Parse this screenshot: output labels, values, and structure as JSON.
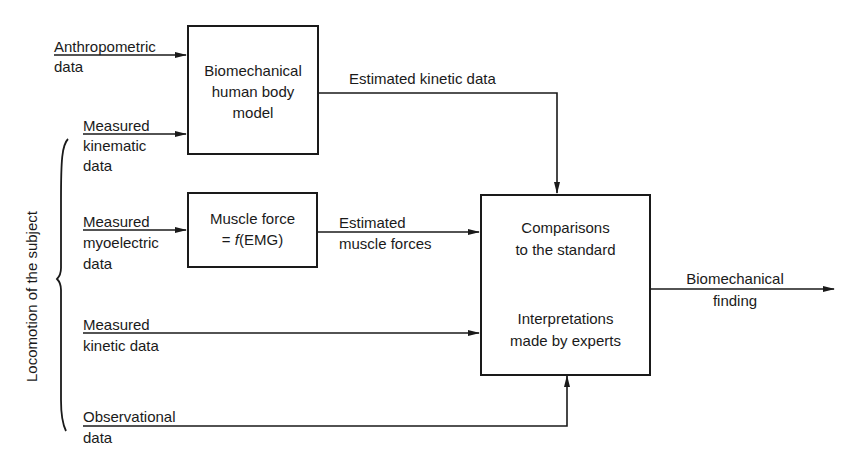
{
  "diagram": {
    "inputs": [
      {
        "id": "anthropometric",
        "line1": "Anthropometric",
        "line2": "data"
      },
      {
        "id": "kinematic",
        "line1": "Measured",
        "line2": "kinematic",
        "line3": "data"
      },
      {
        "id": "myoelectric",
        "line1": "Measured",
        "line2": "myoelectric",
        "line3": "data"
      },
      {
        "id": "kinetic",
        "line1": "Measured",
        "line2": "kinetic data"
      },
      {
        "id": "observational",
        "line1": "Observational",
        "line2": "data"
      }
    ],
    "group_label": "Locomotion of the subject",
    "boxes": {
      "body_model": {
        "line1": "Biomechanical",
        "line2": "human body",
        "line3": "model"
      },
      "muscle_force": {
        "line1": "Muscle force",
        "line2_prefix": "= ",
        "line2_fn": "f",
        "line2_suffix": "(EMG)"
      },
      "comparison": {
        "line1": "Comparisons",
        "line2": "to the standard",
        "line3": "Interpretations",
        "line4": "made by experts"
      }
    },
    "edges": {
      "estimated_kinetic": "Estimated kinetic data",
      "estimated_muscle_line1": "Estimated",
      "estimated_muscle_line2": "muscle forces",
      "output_line1": "Biomechanical",
      "output_line2": "finding"
    },
    "colors": {
      "ink": "#1a1a1a",
      "background": "#ffffff"
    }
  }
}
